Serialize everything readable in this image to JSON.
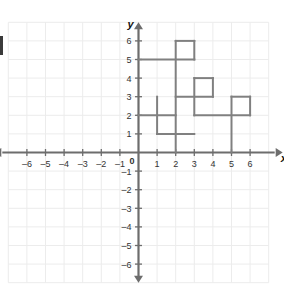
{
  "chart_data": {
    "type": "line",
    "title": "",
    "subtitle": "",
    "xlabel": "x",
    "ylabel": "y",
    "xlim": [
      -6.9,
      6.9
    ],
    "ylim": [
      -6.9,
      6.9
    ],
    "xticks": [
      -6,
      -5,
      -4,
      -3,
      -2,
      -1,
      1,
      2,
      3,
      4,
      5,
      6
    ],
    "yticks": [
      6,
      5,
      4,
      3,
      2,
      1,
      -1,
      -2,
      -3,
      -4,
      -5,
      -6
    ],
    "xtick_labels": [
      "–6",
      "–5",
      "–4",
      "–3",
      "–2",
      "–1",
      "1",
      "2",
      "3",
      "4",
      "5",
      "6"
    ],
    "ytick_labels": [
      "6",
      "5",
      "4",
      "3",
      "2",
      "1",
      "–1",
      "–2",
      "–3",
      "–4",
      "–5",
      "–6"
    ],
    "origin_label": "0",
    "grid": true,
    "grid_color": "#ececec",
    "axis_color": "#6d6d6d",
    "series_color": "#808080",
    "tick_label_color": "#333333",
    "legend": "none",
    "grid_extent": {
      "xmin": -7,
      "xmax": 7,
      "ymin": -7,
      "ymax": 7
    },
    "series": [
      {
        "name": "staircase-path",
        "closed": false,
        "points": [
          [
            0,
            5
          ],
          [
            3,
            5
          ],
          [
            3,
            6
          ],
          [
            2,
            6
          ],
          [
            2,
            0
          ],
          [
            2,
            3
          ],
          [
            4,
            3
          ],
          [
            4,
            4
          ],
          [
            3,
            4
          ],
          [
            3,
            2
          ],
          [
            6,
            2
          ],
          [
            6,
            3
          ],
          [
            5,
            3
          ],
          [
            5,
            0
          ],
          [
            5,
            2
          ],
          [
            0,
            2
          ],
          [
            1,
            2
          ],
          [
            1,
            3
          ],
          [
            1,
            1
          ],
          [
            3,
            1
          ],
          [
            2,
            1
          ],
          [
            2,
            2
          ]
        ],
        "segments": [
          {
            "from": [
              0,
              5
            ],
            "to": [
              3,
              5
            ],
            "orientation": "horizontal"
          },
          {
            "from": [
              3,
              5
            ],
            "to": [
              3,
              6
            ],
            "orientation": "vertical"
          },
          {
            "from": [
              3,
              6
            ],
            "to": [
              2,
              6
            ],
            "orientation": "horizontal"
          },
          {
            "from": [
              2,
              6
            ],
            "to": [
              2,
              0
            ],
            "orientation": "vertical"
          },
          {
            "from": [
              2,
              3
            ],
            "to": [
              4,
              3
            ],
            "orientation": "horizontal"
          },
          {
            "from": [
              4,
              3
            ],
            "to": [
              4,
              4
            ],
            "orientation": "vertical"
          },
          {
            "from": [
              4,
              4
            ],
            "to": [
              3,
              4
            ],
            "orientation": "horizontal"
          },
          {
            "from": [
              3,
              4
            ],
            "to": [
              3,
              2
            ],
            "orientation": "vertical"
          },
          {
            "from": [
              3,
              2
            ],
            "to": [
              6,
              2
            ],
            "orientation": "horizontal"
          },
          {
            "from": [
              6,
              2
            ],
            "to": [
              6,
              3
            ],
            "orientation": "vertical"
          },
          {
            "from": [
              6,
              3
            ],
            "to": [
              5,
              3
            ],
            "orientation": "horizontal"
          },
          {
            "from": [
              5,
              3
            ],
            "to": [
              5,
              0
            ],
            "orientation": "vertical"
          },
          {
            "from": [
              0,
              2
            ],
            "to": [
              2,
              2
            ],
            "orientation": "horizontal"
          },
          {
            "from": [
              1,
              3
            ],
            "to": [
              1,
              1
            ],
            "orientation": "vertical"
          },
          {
            "from": [
              1,
              1
            ],
            "to": [
              3,
              1
            ],
            "orientation": "horizontal"
          }
        ]
      }
    ]
  }
}
